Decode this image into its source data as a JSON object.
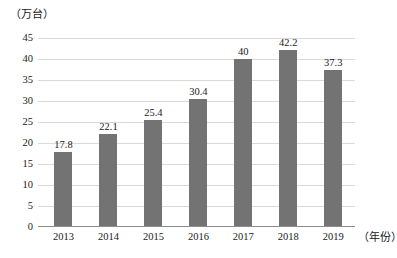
{
  "chart_data": {
    "type": "bar",
    "title": "",
    "subtitle": "",
    "xlabel": "（年份）",
    "ylabel": "（万台）",
    "categories": [
      "2013",
      "2014",
      "2015",
      "2016",
      "2017",
      "2018",
      "2019"
    ],
    "values": [
      17.8,
      22.1,
      25.4,
      30.4,
      40,
      42.2,
      37.3
    ],
    "value_labels": [
      "17.8",
      "22.1",
      "25.4",
      "30.4",
      "40",
      "42.2",
      "37.3"
    ],
    "series": [
      {
        "name": "",
        "values": [
          17.8,
          22.1,
          25.4,
          30.4,
          40,
          42.2,
          37.3
        ]
      }
    ],
    "ylim": [
      0,
      45
    ],
    "ytick_step": 5,
    "ytick_labels": [
      "0",
      "5",
      "10",
      "15",
      "20",
      "25",
      "30",
      "35",
      "40",
      "45"
    ],
    "ytick_values": [
      0,
      5,
      10,
      15,
      20,
      25,
      30,
      35,
      40,
      45
    ],
    "grid": true,
    "grid_axis": "y",
    "legend": false,
    "legend_position": "none",
    "bar_color": "#737373",
    "gridline_color": "#d9d9d9",
    "axis_color": "#8c8c8c",
    "background_color": "#ffffff"
  }
}
